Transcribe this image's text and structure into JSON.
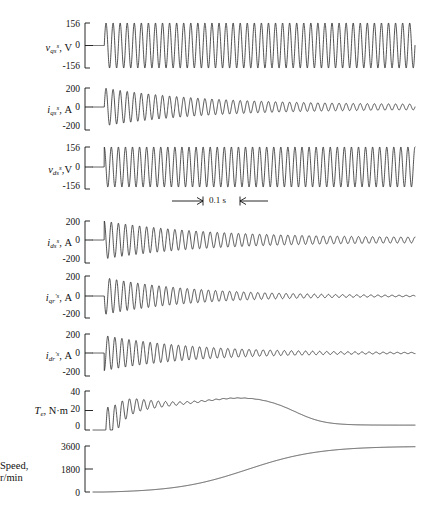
{
  "figure": {
    "background_color": "#ffffff",
    "trace_color": "#1a1a1a",
    "axis_color": "#111111",
    "time_marker": {
      "label": "0.1 s",
      "left_arrow": "→",
      "right_arrow": "←"
    }
  },
  "chart_data": [
    {
      "type": "line",
      "id": "vqs",
      "title": "",
      "ylabel": "v_qs^s, V",
      "ylabel_parts": {
        "symbol": "v",
        "sub": "qs",
        "sup": "s",
        "unit": "V"
      },
      "xlabel": "",
      "ylim": [
        -156,
        156
      ],
      "yticks": [
        156,
        0,
        -156
      ],
      "ytick_labels": [
        "156",
        "0",
        "-156"
      ],
      "grid": false,
      "waveform": "sinusoid",
      "amplitude": 156,
      "cycles": 44,
      "decay": "none",
      "phase_deg": 0,
      "start_fraction": 0.035,
      "description": "Stationary-frame q-axis stator voltage, constant amplitude 60 Hz sinusoid"
    },
    {
      "type": "line",
      "id": "iqs",
      "title": "",
      "ylabel": "i_qs^s, A",
      "ylabel_parts": {
        "symbol": "i",
        "sub": "qs",
        "sup": "s",
        "unit": "A"
      },
      "xlabel": "",
      "ylim": [
        -200,
        200
      ],
      "yticks": [
        200,
        0,
        -200
      ],
      "ytick_labels": [
        "200",
        "0",
        "-200"
      ],
      "grid": false,
      "waveform": "decaying-sinusoid",
      "amplitude": 200,
      "final_amplitude": 22,
      "cycles": 44,
      "decay": "envelope-to-small-ripple",
      "phase_deg": 0,
      "start_fraction": 0.035,
      "description": "Stationary-frame q-axis stator current, large inrush decaying to steady state"
    },
    {
      "type": "line",
      "id": "vds",
      "title": "",
      "ylabel": "v_ds^s, V",
      "ylabel_parts": {
        "symbol": "v",
        "sub": "ds",
        "sup": "s",
        "unit": "V"
      },
      "xlabel": "",
      "ylim": [
        -156,
        156
      ],
      "yticks": [
        156,
        0,
        -156
      ],
      "ytick_labels": [
        "156",
        "0",
        "-156"
      ],
      "grid": false,
      "waveform": "sinusoid",
      "amplitude": 156,
      "cycles": 44,
      "decay": "none",
      "phase_deg": 90,
      "start_fraction": 0.035,
      "description": "Stationary-frame d-axis stator voltage, constant amplitude, 90 deg from q-axis"
    },
    {
      "type": "line",
      "id": "ids",
      "title": "",
      "ylabel": "i_ds^s, A",
      "ylabel_parts": {
        "symbol": "i",
        "sub": "ds",
        "sup": "s",
        "unit": "A"
      },
      "xlabel": "",
      "ylim": [
        -200,
        200
      ],
      "yticks": [
        200,
        0,
        -200
      ],
      "ytick_labels": [
        "200",
        "0",
        "-200"
      ],
      "grid": false,
      "waveform": "decaying-sinusoid",
      "amplitude": 200,
      "final_amplitude": 22,
      "cycles": 44,
      "decay": "envelope-to-small-ripple",
      "phase_deg": 90,
      "start_fraction": 0.035,
      "description": "Stationary-frame d-axis stator current, inrush decaying to steady ripple"
    },
    {
      "type": "line",
      "id": "iqr",
      "title": "",
      "ylabel": "i'_qr^s, A",
      "ylabel_parts": {
        "symbol": "i",
        "sub": "qr",
        "sup": "'s",
        "unit": "A"
      },
      "xlabel": "",
      "ylim": [
        -200,
        200
      ],
      "yticks": [
        200,
        0,
        -200
      ],
      "ytick_labels": [
        "200",
        "0",
        "-200"
      ],
      "grid": false,
      "waveform": "decaying-sinusoid",
      "amplitude": 185,
      "final_amplitude": 0,
      "cycles": 44,
      "decay": "envelope-to-zero",
      "phase_deg": 180,
      "start_fraction": 0.035,
      "description": "Stationary-frame q-axis rotor current referred to stator, decays to zero"
    },
    {
      "type": "line",
      "id": "idr",
      "title": "",
      "ylabel": "i'_dr^s, A",
      "ylabel_parts": {
        "symbol": "i",
        "sub": "dr",
        "sup": "'s",
        "unit": "A"
      },
      "xlabel": "",
      "ylim": [
        -200,
        200
      ],
      "yticks": [
        200,
        0,
        -200
      ],
      "ytick_labels": [
        "200",
        "0",
        "-200"
      ],
      "grid": false,
      "waveform": "decaying-sinusoid",
      "amplitude": 185,
      "final_amplitude": 0,
      "cycles": 44,
      "decay": "envelope-to-zero",
      "phase_deg": 270,
      "start_fraction": 0.035,
      "description": "Stationary-frame d-axis rotor current referred to stator, decays to zero"
    },
    {
      "type": "line",
      "id": "torque",
      "title": "",
      "ylabel": "T_e, N·m",
      "ylabel_parts": {
        "symbol": "T",
        "sub": "e",
        "sup": "",
        "unit": "N·m"
      },
      "xlabel": "",
      "ylim": [
        0,
        40
      ],
      "yticks": [
        40,
        20,
        0
      ],
      "ytick_labels": [
        "40",
        "20",
        "0"
      ],
      "grid": false,
      "waveform": "damped-oscillation-then-plateau",
      "peak": 40,
      "plateau": 26,
      "final_value": 5,
      "start_fraction": 0.035,
      "description": "Electromagnetic torque: transient oscillation, plateau near 26 N·m, settles to load torque"
    },
    {
      "type": "line",
      "id": "speed",
      "title": "",
      "ylabel": "Speed, r/min",
      "ylabel_parts": {
        "symbol": "Speed,",
        "sub": "",
        "sup": "",
        "unit": "r/min"
      },
      "xlabel": "",
      "ylim": [
        0,
        3600
      ],
      "yticks": [
        3600,
        1800,
        0
      ],
      "ytick_labels": [
        "3600",
        "1800",
        "0"
      ],
      "grid": false,
      "waveform": "s-curve",
      "final_value": 3600,
      "start_fraction": 0.035,
      "description": "Rotor speed accelerating from standstill to synchronous speed 3600 r/min"
    }
  ]
}
